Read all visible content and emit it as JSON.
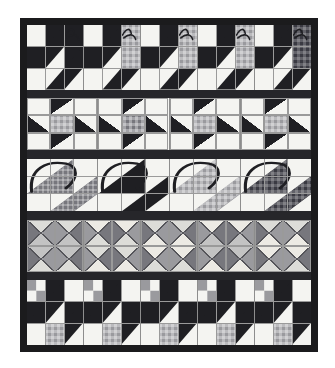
{
  "artwork": {
    "title": "Sampler quilt",
    "description": "Pieced patchwork quilt photographed flat, five horizontal block rows separated by dark sashing, framed by a wide dark outer border.",
    "background_color": "#ffffff",
    "border_color": "#1b1b1d",
    "sashing_color": "#26262a",
    "background_fabric": "#f4f4f1",
    "seam_line_color": "#9a9a9a"
  },
  "palette": {
    "white": "#f4f4f1",
    "off_white": "#eceae4",
    "black": "#1f1f23",
    "charcoal": "#34343a",
    "dark_plaid": "#3a3a42",
    "mid_gray": "#77777d",
    "gray_plaid": "#9a9a9e",
    "light_gray": "#c3c3c3",
    "pale_gray": "#dcdcd8"
  },
  "layout": {
    "rows": 5,
    "outer_border_px": 7,
    "quilt_left_px": 20,
    "quilt_top_px": 18,
    "quilt_width_px": 298,
    "quilt_height_px": 334
  },
  "rows": [
    {
      "index": 1,
      "name": "bug-row-top",
      "pattern": "bug",
      "block_count": 5,
      "height_pct": 21.5,
      "blocks": [
        {
          "body": "#1f1f23",
          "wing": "#1f1f23",
          "sky": "#f4f4f1",
          "accent": "#f4f4f1",
          "body_texture": "solid"
        },
        {
          "body": "#1f1f23",
          "wing": "#9a9a9e",
          "sky": "#f4f4f1",
          "accent": "#9a9a9e",
          "body_texture": "plaid-gray"
        },
        {
          "body": "#1f1f23",
          "wing": "#9a9a9e",
          "sky": "#f4f4f1",
          "accent": "#9a9a9e",
          "body_texture": "plaid-gray"
        },
        {
          "body": "#1f1f23",
          "wing": "#9a9a9e",
          "sky": "#f4f4f1",
          "accent": "#9a9a9e",
          "body_texture": "plaid-gray"
        },
        {
          "body": "#1f1f23",
          "wing": "#3a3a42",
          "sky": "#f4f4f1",
          "accent": "#3a3a42",
          "body_texture": "plaid-dark"
        }
      ]
    },
    {
      "index": 2,
      "name": "star-row",
      "pattern": "star",
      "block_count": 4,
      "height_pct": 17.5,
      "blocks": [
        {
          "point": "#1f1f23",
          "center": "#9a9a9e",
          "sky": "#f4f4f1"
        },
        {
          "point": "#1f1f23",
          "center": "#77777d",
          "sky": "#f4f4f1"
        },
        {
          "point": "#1f1f23",
          "center": "#9a9a9e",
          "sky": "#f4f4f1"
        },
        {
          "point": "#1f1f23",
          "center": "#9a9a9e",
          "sky": "#f4f4f1"
        }
      ]
    },
    {
      "index": 3,
      "name": "basket-row",
      "pattern": "cup",
      "block_count": 4,
      "height_pct": 17.5,
      "blocks": [
        {
          "cup": "#77777d",
          "handle": "#1f1f23",
          "sky": "#f4f4f1",
          "cup_texture": "plaid-mid"
        },
        {
          "cup": "#1f1f23",
          "handle": "#1f1f23",
          "sky": "#f4f4f1",
          "cup_texture": "solid"
        },
        {
          "cup": "#9a9a9e",
          "handle": "#1f1f23",
          "sky": "#f4f4f1",
          "cup_texture": "plaid-gray"
        },
        {
          "cup": "#3a3a42",
          "handle": "#1f1f23",
          "sky": "#f4f4f1",
          "cup_texture": "plaid-dark"
        }
      ]
    },
    {
      "index": 4,
      "name": "hourglass-row",
      "pattern": "hourglass",
      "block_count": 5,
      "height_pct": 17.5,
      "blocks": [
        {
          "up": "#dcdcd8",
          "right": "#9a9a9e",
          "down": "#c3c3c3",
          "left": "#77777d"
        },
        {
          "up": "#eceae4",
          "right": "#77777d",
          "down": "#dcdcd8",
          "left": "#9a9a9e"
        },
        {
          "up": "#dcdcd8",
          "right": "#9a9a9e",
          "down": "#eceae4",
          "left": "#77777d"
        },
        {
          "up": "#eceae4",
          "right": "#77777d",
          "down": "#c3c3c3",
          "left": "#9a9a9e"
        },
        {
          "up": "#dcdcd8",
          "right": "#9a9a9e",
          "down": "#eceae4",
          "left": "#77777d"
        }
      ]
    },
    {
      "index": 5,
      "name": "bug-row-bottom",
      "pattern": "bug2",
      "block_count": 5,
      "height_pct": 21.5,
      "blocks": [
        {
          "body": "#1f1f23",
          "wing": "#9a9a9e",
          "sky": "#f4f4f1",
          "accent": "#9a9a9e",
          "body_texture": "plaid-gray"
        },
        {
          "body": "#1f1f23",
          "wing": "#9a9a9e",
          "sky": "#f4f4f1",
          "accent": "#9a9a9e",
          "body_texture": "plaid-gray"
        },
        {
          "body": "#1f1f23",
          "wing": "#9a9a9e",
          "sky": "#f4f4f1",
          "accent": "#9a9a9e",
          "body_texture": "plaid-gray"
        },
        {
          "body": "#1f1f23",
          "wing": "#9a9a9e",
          "sky": "#f4f4f1",
          "accent": "#9a9a9e",
          "body_texture": "plaid-gray"
        },
        {
          "body": "#1f1f23",
          "wing": "#9a9a9e",
          "sky": "#f4f4f1",
          "accent": "#9a9a9e",
          "body_texture": "plaid-gray"
        }
      ]
    }
  ]
}
